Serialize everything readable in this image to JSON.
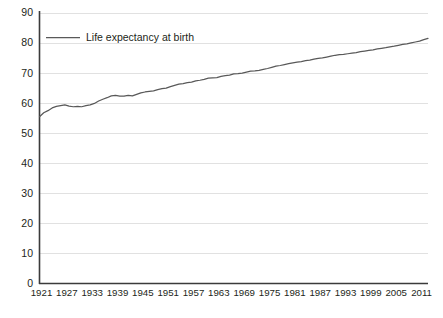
{
  "chart_data": {
    "type": "line",
    "title": "",
    "subtitle": "",
    "xlabel": "",
    "ylabel": "",
    "legend_position": "top-left",
    "grid": "horizontal",
    "ylim": [
      0,
      90
    ],
    "yticks": [
      0,
      10,
      20,
      30,
      40,
      50,
      60,
      70,
      80,
      90
    ],
    "xlim": [
      1921,
      2013
    ],
    "xticks": [
      1921,
      1927,
      1933,
      1939,
      1945,
      1951,
      1957,
      1963,
      1969,
      1975,
      1981,
      1987,
      1993,
      1999,
      2005,
      2011
    ],
    "xtick_labels": [
      "1921",
      "1927",
      "1933",
      "1939",
      "1945",
      "1951",
      "1957",
      "1963",
      "1969",
      "1975",
      "1981",
      "1987",
      "1993",
      "1999",
      "2005",
      "2011"
    ],
    "ytick_labels": [
      "0",
      "10",
      "20",
      "30",
      "40",
      "50",
      "60",
      "70",
      "80",
      "90"
    ],
    "series": [
      {
        "name": "Life expectancy at birth",
        "color": "#595959",
        "x": [
          1921,
          1922,
          1923,
          1924,
          1925,
          1926,
          1927,
          1928,
          1929,
          1930,
          1931,
          1932,
          1933,
          1934,
          1935,
          1936,
          1937,
          1938,
          1939,
          1940,
          1941,
          1942,
          1943,
          1944,
          1945,
          1946,
          1947,
          1948,
          1949,
          1950,
          1951,
          1952,
          1953,
          1954,
          1955,
          1956,
          1957,
          1958,
          1959,
          1960,
          1961,
          1962,
          1963,
          1964,
          1965,
          1966,
          1967,
          1968,
          1969,
          1970,
          1971,
          1972,
          1973,
          1974,
          1975,
          1976,
          1977,
          1978,
          1979,
          1980,
          1981,
          1982,
          1983,
          1984,
          1985,
          1986,
          1987,
          1988,
          1989,
          1990,
          1991,
          1992,
          1993,
          1994,
          1995,
          1996,
          1997,
          1998,
          1999,
          2000,
          2001,
          2002,
          2003,
          2004,
          2005,
          2006,
          2007,
          2008,
          2009,
          2010,
          2011,
          2012,
          2013
        ],
        "values": [
          55.4,
          56.7,
          57.4,
          58.3,
          58.8,
          59.1,
          59.3,
          58.9,
          58.7,
          58.8,
          58.7,
          59.1,
          59.3,
          59.8,
          60.6,
          61.2,
          61.7,
          62.3,
          62.5,
          62.2,
          62.2,
          62.5,
          62.3,
          62.8,
          63.3,
          63.6,
          63.8,
          64.0,
          64.4,
          64.7,
          64.9,
          65.4,
          65.8,
          66.2,
          66.4,
          66.7,
          66.9,
          67.3,
          67.5,
          67.8,
          68.2,
          68.3,
          68.4,
          68.8,
          69.0,
          69.2,
          69.6,
          69.7,
          69.9,
          70.2,
          70.5,
          70.6,
          70.8,
          71.1,
          71.4,
          71.8,
          72.2,
          72.4,
          72.7,
          73.0,
          73.3,
          73.5,
          73.7,
          74.0,
          74.2,
          74.5,
          74.8,
          74.9,
          75.2,
          75.5,
          75.8,
          76.0,
          76.1,
          76.3,
          76.5,
          76.7,
          77.0,
          77.2,
          77.4,
          77.6,
          77.9,
          78.1,
          78.3,
          78.6,
          78.8,
          79.1,
          79.4,
          79.6,
          79.9,
          80.2,
          80.5,
          81.0,
          81.4
        ]
      }
    ]
  },
  "legend": {
    "entries": [
      {
        "label": "Life expectancy at birth",
        "color": "#595959"
      }
    ]
  },
  "axes": {
    "axis_color": "#3b3b3b",
    "grid_color": "#d9d9d9"
  }
}
